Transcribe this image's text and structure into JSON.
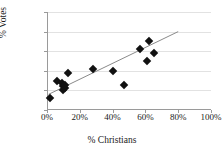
{
  "chart_data": {
    "type": "scatter",
    "title": "",
    "xlabel": "% Christians",
    "ylabel": "% Votes",
    "xlim": [
      0,
      100
    ],
    "ylim": [
      0,
      50
    ],
    "xticks": [
      "0%",
      "20%",
      "40%",
      "60%",
      "80%",
      "100%"
    ],
    "xtick_values": [
      0,
      20,
      40,
      60,
      80,
      100
    ],
    "yticks": [
      "0%",
      "10%",
      "20%",
      "30%",
      "40%",
      "50%"
    ],
    "ytick_values": [
      0,
      10,
      20,
      30,
      40,
      50
    ],
    "grid": true,
    "legend": "none",
    "marker_style": "diamond",
    "marker_color": "#111111",
    "trendline_color": "#8a8a8a",
    "points": [
      {
        "x": 2,
        "y": 6
      },
      {
        "x": 6,
        "y": 15
      },
      {
        "x": 9,
        "y": 14
      },
      {
        "x": 10,
        "y": 12
      },
      {
        "x": 10,
        "y": 10
      },
      {
        "x": 11,
        "y": 11
      },
      {
        "x": 11,
        "y": 13
      },
      {
        "x": 13,
        "y": 19
      },
      {
        "x": 28,
        "y": 21
      },
      {
        "x": 40,
        "y": 20
      },
      {
        "x": 47,
        "y": 13
      },
      {
        "x": 57,
        "y": 31
      },
      {
        "x": 61,
        "y": 25
      },
      {
        "x": 62,
        "y": 35
      },
      {
        "x": 65,
        "y": 29
      }
    ],
    "trendline": {
      "x0": 1,
      "y0": 8,
      "x1": 80,
      "y1": 40
    }
  }
}
